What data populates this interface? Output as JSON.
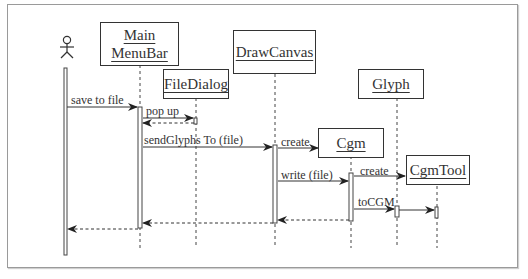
{
  "diagram": {
    "type": "UML sequence diagram",
    "actor": {
      "name": "actor",
      "icon": "stick-figure-icon"
    },
    "objects": [
      {
        "id": "mainmenubar",
        "lines": [
          "Main",
          "MenuBar"
        ]
      },
      {
        "id": "filedialog",
        "lines": [
          "FileDialog"
        ]
      },
      {
        "id": "drawcanvas",
        "lines": [
          "DrawCanvas"
        ]
      },
      {
        "id": "glyph",
        "lines": [
          "Glyph"
        ]
      },
      {
        "id": "cgm",
        "lines": [
          "Cgm"
        ]
      },
      {
        "id": "cgmtool",
        "lines": [
          "CgmTool"
        ]
      }
    ],
    "messages": [
      {
        "from": "actor",
        "to": "mainmenubar",
        "label": "save to file",
        "kind": "call"
      },
      {
        "from": "mainmenubar",
        "to": "filedialog",
        "label": "pop up",
        "kind": "call"
      },
      {
        "from": "filedialog",
        "to": "mainmenubar",
        "label": "",
        "kind": "return"
      },
      {
        "from": "mainmenubar",
        "to": "drawcanvas",
        "label": "sendGlyphs To (file)",
        "kind": "call"
      },
      {
        "from": "drawcanvas",
        "to": "cgm",
        "label": "create",
        "kind": "create"
      },
      {
        "from": "drawcanvas",
        "to": "cgm",
        "label": "write (file)",
        "kind": "call"
      },
      {
        "from": "cgm",
        "to": "cgmtool",
        "label": "create",
        "kind": "create"
      },
      {
        "from": "cgm",
        "to": "glyph",
        "label": "toCGM",
        "kind": "call"
      },
      {
        "from": "glyph",
        "to": "cgmtool",
        "label": "",
        "kind": "call"
      },
      {
        "from": "cgm",
        "to": "drawcanvas",
        "label": "",
        "kind": "return"
      },
      {
        "from": "drawcanvas",
        "to": "mainmenubar",
        "label": "",
        "kind": "return"
      },
      {
        "from": "mainmenubar",
        "to": "actor",
        "label": "",
        "kind": "return"
      }
    ]
  }
}
